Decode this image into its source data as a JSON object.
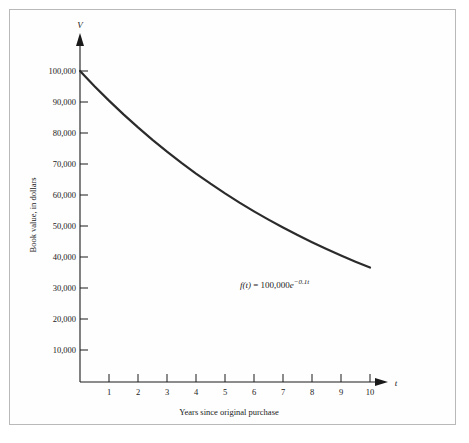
{
  "figure": {
    "background_color": "#ffffff",
    "border_color": "#b9b9b9",
    "curve_color": "#2b2b2b",
    "axis_color": "#1a1a1a",
    "y_axis_name": "V",
    "x_axis_name": "t",
    "y_axis_title": "Book value, in dollars",
    "x_axis_title": "Years since original purchase",
    "formula_f": "f",
    "formula_arg": "(t)",
    "formula_eq": " = 100,000",
    "formula_base": "e",
    "formula_exp": "−0.1t",
    "formula_full": "f(t) = 100,000e−0.1t"
  },
  "chart_data": {
    "type": "line",
    "title": "",
    "subtitle": "",
    "xlabel": "Years since original purchase",
    "ylabel": "Book value, in dollars",
    "xlim": [
      0,
      11.2
    ],
    "ylim": [
      0,
      107000
    ],
    "grid": false,
    "legend": null,
    "x_tick_labels": [
      "1",
      "2",
      "3",
      "4",
      "5",
      "6",
      "7",
      "8",
      "9",
      "10"
    ],
    "x_ticks": [
      1,
      2,
      3,
      4,
      5,
      6,
      7,
      8,
      9,
      10
    ],
    "y_tick_labels": [
      "10,000",
      "20,000",
      "30,000",
      "40,000",
      "50,000",
      "60,000",
      "70,000",
      "80,000",
      "90,000",
      "100,000"
    ],
    "y_ticks": [
      10000,
      20000,
      30000,
      40000,
      50000,
      60000,
      70000,
      80000,
      90000,
      100000
    ],
    "annotations": [
      {
        "text": "f(t) = 100,000e−0.1t",
        "x": 6.6,
        "y": 30500
      }
    ],
    "series": [
      {
        "name": "f(t) = 100,000e^(-0.1t)",
        "color": "#2b2b2b",
        "x": [
          0,
          0.5,
          1,
          1.5,
          2,
          2.5,
          3,
          3.5,
          4,
          4.5,
          5,
          5.5,
          6,
          6.5,
          7,
          7.5,
          8,
          8.5,
          9,
          9.5,
          10
        ],
        "values": [
          100000,
          95123,
          90484,
          86071,
          81873,
          77880,
          74082,
          70469,
          67032,
          63763,
          60653,
          57695,
          54881,
          52205,
          49659,
          47237,
          44933,
          42741,
          40657,
          38674,
          36788
        ]
      }
    ]
  }
}
